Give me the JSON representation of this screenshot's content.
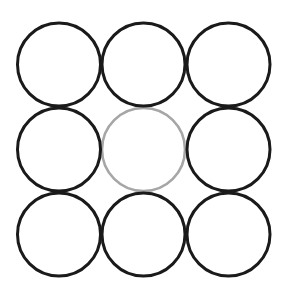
{
  "diagram": {
    "type": "circle-grid",
    "rows": 3,
    "cols": 3,
    "radius": 41.5,
    "background": "#ffffff",
    "colors": {
      "default_stroke": "#1a1a1a",
      "highlight_stroke": "#a6a6a6"
    },
    "stroke_widths": {
      "default": 3,
      "highlight": 2.6
    },
    "column_centers_x": [
      59,
      143.5,
      228.5
    ],
    "row_centers_y": [
      64.5,
      149.5,
      234.5
    ],
    "circles": [
      {
        "row": 0,
        "col": 0,
        "style": "default"
      },
      {
        "row": 0,
        "col": 1,
        "style": "default"
      },
      {
        "row": 0,
        "col": 2,
        "style": "default"
      },
      {
        "row": 1,
        "col": 0,
        "style": "default"
      },
      {
        "row": 1,
        "col": 1,
        "style": "highlight"
      },
      {
        "row": 1,
        "col": 2,
        "style": "default"
      },
      {
        "row": 2,
        "col": 0,
        "style": "default"
      },
      {
        "row": 2,
        "col": 1,
        "style": "default"
      },
      {
        "row": 2,
        "col": 2,
        "style": "default"
      }
    ]
  }
}
